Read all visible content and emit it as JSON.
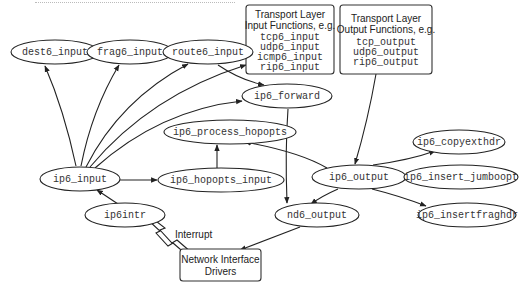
{
  "diagram": {
    "type": "call-graph",
    "nodes": {
      "dest6_input": {
        "label": "dest6_input",
        "shape": "ellipse"
      },
      "frag6_input": {
        "label": "frag6_input",
        "shape": "ellipse"
      },
      "route6_input": {
        "label": "route6_input",
        "shape": "ellipse"
      },
      "ip6_forward": {
        "label": "ip6_forward",
        "shape": "ellipse"
      },
      "ip6_process_hopopts": {
        "label": "ip6_process_hopopts",
        "shape": "ellipse"
      },
      "ip6_input": {
        "label": "ip6_input",
        "shape": "ellipse"
      },
      "ip6_hopopts_input": {
        "label": "ip6_hopopts_input",
        "shape": "ellipse"
      },
      "ip6_output": {
        "label": "ip6_output",
        "shape": "ellipse"
      },
      "ip6_copyexthdr": {
        "label": "ip6_copyexthdr",
        "shape": "ellipse"
      },
      "ip6_insert_jumboopt": {
        "label": "ip6_insert_jumboopt",
        "shape": "ellipse"
      },
      "ip6_insertfraghdr": {
        "label": "ip6_insertfraghdr",
        "shape": "ellipse"
      },
      "ip6intr": {
        "label": "ip6intr",
        "shape": "ellipse"
      },
      "nd6_output": {
        "label": "nd6_output",
        "shape": "ellipse"
      }
    },
    "boxes": {
      "transport_input": {
        "title_lines": [
          "Transport Layer",
          "Input Functions, e.g."
        ],
        "functions": [
          "tcp6_input",
          "udp6_input",
          "icmp6_input",
          "rip6_input"
        ]
      },
      "transport_output": {
        "title_lines": [
          "Transport Layer",
          "Output Functions, e.g."
        ],
        "functions": [
          "tcp_output",
          "udp6_output",
          "rip6_output"
        ]
      },
      "network_drivers": {
        "title_lines": [
          "Network Interface",
          "Drivers"
        ]
      }
    },
    "annotations": {
      "interrupt": "Interrupt"
    },
    "edges": [
      {
        "from": "ip6_input",
        "to": "dest6_input"
      },
      {
        "from": "ip6_input",
        "to": "frag6_input"
      },
      {
        "from": "ip6_input",
        "to": "route6_input"
      },
      {
        "from": "ip6_input",
        "to": "transport_input"
      },
      {
        "from": "ip6_input",
        "to": "ip6_forward"
      },
      {
        "from": "ip6_input",
        "to": "ip6_hopopts_input"
      },
      {
        "from": "route6_input",
        "to": "ip6_forward"
      },
      {
        "from": "ip6_hopopts_input",
        "to": "ip6_process_hopopts"
      },
      {
        "from": "ip6_output",
        "to": "ip6_process_hopopts"
      },
      {
        "from": "ip6_forward",
        "to": "nd6_output"
      },
      {
        "from": "transport_output",
        "to": "ip6_output"
      },
      {
        "from": "ip6_output",
        "to": "ip6_copyexthdr"
      },
      {
        "from": "ip6_output",
        "to": "ip6_insert_jumboopt"
      },
      {
        "from": "ip6_output",
        "to": "ip6_insertfraghdr"
      },
      {
        "from": "ip6_output",
        "to": "nd6_output"
      },
      {
        "from": "nd6_output",
        "to": "network_drivers"
      },
      {
        "from": "ip6intr",
        "to": "ip6_input"
      },
      {
        "from": "network_drivers",
        "to": "ip6intr",
        "style": "lightning",
        "label": "Interrupt"
      }
    ]
  }
}
